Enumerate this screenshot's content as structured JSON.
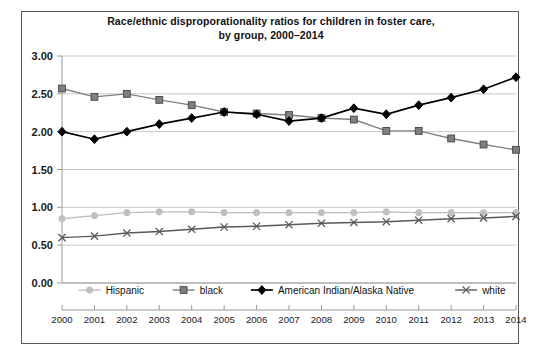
{
  "chart_data": {
    "type": "line",
    "title": "Race/ethnic disproporationality ratios for children in foster care, by group, 2000–2014",
    "title_line1": "Race/ethnic disproporationality ratios for children in foster care,",
    "title_line2": "by group, 2000–2014",
    "xlabel": "",
    "ylabel": "",
    "grid": true,
    "legend_position": "bottom",
    "ylim": [
      0.0,
      3.0
    ],
    "ytick_labels": [
      "0.00",
      "0.50",
      "1.00",
      "1.50",
      "2.00",
      "2.50",
      "3.00"
    ],
    "yticks": [
      0.0,
      0.5,
      1.0,
      1.5,
      2.0,
      2.5,
      3.0
    ],
    "categories": [
      "2000",
      "2001",
      "2002",
      "2003",
      "2004",
      "2005",
      "2006",
      "2007",
      "2008",
      "2009",
      "2010",
      "2011",
      "2012",
      "2013",
      "2014"
    ],
    "x": [
      2000,
      2001,
      2002,
      2003,
      2004,
      2005,
      2006,
      2007,
      2008,
      2009,
      2010,
      2011,
      2012,
      2013,
      2014
    ],
    "series": [
      {
        "name": "Hispanic",
        "color": "#bfbfbf",
        "marker": "circle",
        "values": [
          0.85,
          0.89,
          0.93,
          0.94,
          0.94,
          0.93,
          0.93,
          0.93,
          0.93,
          0.93,
          0.94,
          0.93,
          0.93,
          0.93,
          0.93
        ]
      },
      {
        "name": "black",
        "color": "#808080",
        "marker": "square",
        "values": [
          2.57,
          2.46,
          2.5,
          2.42,
          2.35,
          2.26,
          2.24,
          2.22,
          2.18,
          2.16,
          2.01,
          2.01,
          1.91,
          1.83,
          1.76
        ]
      },
      {
        "name": "American Indian/Alaska Native",
        "color": "#000000",
        "marker": "diamond",
        "values": [
          2.0,
          1.9,
          2.0,
          2.1,
          2.18,
          2.26,
          2.23,
          2.14,
          2.18,
          2.31,
          2.23,
          2.35,
          2.45,
          2.56,
          2.72
        ]
      },
      {
        "name": "white",
        "color": "#595959",
        "marker": "x",
        "values": [
          0.6,
          0.62,
          0.66,
          0.68,
          0.71,
          0.74,
          0.75,
          0.77,
          0.79,
          0.8,
          0.81,
          0.83,
          0.85,
          0.86,
          0.88
        ]
      }
    ]
  }
}
